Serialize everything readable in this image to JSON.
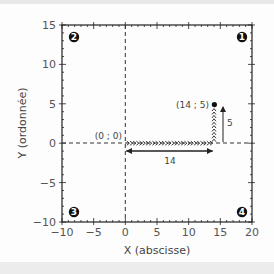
{
  "chart_data": {
    "type": "scatter",
    "title": "",
    "xlabel": "X (abscisse)",
    "ylabel": "Y (ordonnée)",
    "xlim": [
      -10,
      20
    ],
    "ylim": [
      -10,
      15
    ],
    "x_ticks": [
      "−10",
      "−5",
      "0",
      "5",
      "10",
      "15",
      "20"
    ],
    "y_ticks": [
      "−10",
      "−5",
      "0",
      "5",
      "10",
      "15"
    ],
    "grid": false,
    "points": [
      {
        "label": "(0 ; 0)",
        "x": 0,
        "y": 0
      },
      {
        "label": "(14 ; 5)",
        "x": 14,
        "y": 5
      }
    ],
    "path": [
      {
        "from": [
          0,
          0
        ],
        "to": [
          14,
          0
        ],
        "style": "chevron-arrows"
      },
      {
        "from": [
          14,
          0
        ],
        "to": [
          14,
          5
        ],
        "style": "chevron-arrows"
      }
    ],
    "annotations": [
      {
        "text": "14",
        "type": "horizontal-displacement",
        "from": 0,
        "to": 14
      },
      {
        "text": "5",
        "type": "vertical-displacement",
        "from": 0,
        "to": 5
      }
    ],
    "quadrants": [
      {
        "label": "1",
        "glyph": "❶",
        "position": "top-right"
      },
      {
        "label": "2",
        "glyph": "❷",
        "position": "top-left"
      },
      {
        "label": "3",
        "glyph": "❸",
        "position": "bottom-left"
      },
      {
        "label": "4",
        "glyph": "❹",
        "position": "bottom-right"
      }
    ]
  },
  "labels": {
    "origin": "(0 ; 0)",
    "point": "(14 ; 5)",
    "dx": "14",
    "dy": "5",
    "xlabel": "X (abscisse)",
    "ylabel": "Y (ordonnée)",
    "xt": [
      "−10",
      "−5",
      "0",
      "5",
      "10",
      "15",
      "20"
    ],
    "yt": [
      "−10",
      "−5",
      "0",
      "5",
      "10",
      "15"
    ],
    "q": [
      "1",
      "2",
      "3",
      "4"
    ]
  },
  "colors": {
    "axis": "#222222",
    "text": "#555555",
    "marker": "#111111"
  }
}
